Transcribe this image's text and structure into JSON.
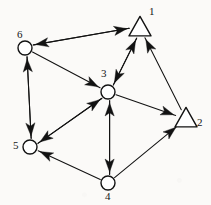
{
  "figure": {
    "top_text_remnant": "— —  ———— ——  — —— — —",
    "stroke_color": "#121212",
    "fill_color": "#ffffff",
    "background": "#fbfaf8",
    "nodes": [
      {
        "id": "1",
        "label": "1",
        "shape": "triangle",
        "x": 140,
        "y": 28,
        "size": 11,
        "label_x": 149,
        "label_y": 6
      },
      {
        "id": "2",
        "label": "2",
        "shape": "triangle",
        "x": 186,
        "y": 119,
        "size": 11,
        "label_x": 197,
        "label_y": 117
      },
      {
        "id": "3",
        "label": "3",
        "shape": "circle",
        "x": 108,
        "y": 92,
        "size": 7,
        "label_x": 101,
        "label_y": 68
      },
      {
        "id": "4",
        "label": "4",
        "shape": "circle",
        "x": 108,
        "y": 183,
        "size": 7,
        "label_x": 105,
        "label_y": 191
      },
      {
        "id": "5",
        "label": "5",
        "shape": "circle",
        "x": 30,
        "y": 147,
        "size": 7,
        "label_x": 13,
        "label_y": 140
      },
      {
        "id": "6",
        "label": "6",
        "shape": "circle",
        "x": 25,
        "y": 48,
        "size": 7,
        "label_x": 17,
        "label_y": 29
      }
    ],
    "edges": [
      {
        "from": "6",
        "to": "1",
        "arrow_at": "to",
        "name": "edge-6-to-1"
      },
      {
        "from": "1",
        "to": "6",
        "arrow_at": "to",
        "name": "edge-1-to-6"
      },
      {
        "from": "6",
        "to": "5",
        "arrow_at": "to",
        "name": "edge-6-to-5"
      },
      {
        "from": "5",
        "to": "6",
        "arrow_at": "to",
        "name": "edge-5-to-6"
      },
      {
        "from": "6",
        "to": "3",
        "arrow_at": "to",
        "name": "edge-6-to-3"
      },
      {
        "from": "1",
        "to": "3",
        "arrow_at": "to",
        "name": "edge-1-to-3"
      },
      {
        "from": "3",
        "to": "1",
        "arrow_at": "to",
        "name": "edge-3-to-1"
      },
      {
        "from": "2",
        "to": "1",
        "arrow_at": "to",
        "name": "edge-2-to-1"
      },
      {
        "from": "3",
        "to": "2",
        "arrow_at": "to",
        "name": "edge-3-to-2"
      },
      {
        "from": "4",
        "to": "2",
        "arrow_at": "to",
        "name": "edge-4-to-2"
      },
      {
        "from": "3",
        "to": "4",
        "arrow_at": "to",
        "name": "edge-3-to-4"
      },
      {
        "from": "4",
        "to": "3",
        "arrow_at": "to",
        "name": "edge-4-to-3"
      },
      {
        "from": "3",
        "to": "5",
        "arrow_at": "to",
        "name": "edge-3-to-5"
      },
      {
        "from": "5",
        "to": "3",
        "arrow_at": "to",
        "name": "edge-5-to-3"
      },
      {
        "from": "4",
        "to": "5",
        "arrow_at": "to",
        "name": "edge-4-to-5"
      }
    ]
  }
}
